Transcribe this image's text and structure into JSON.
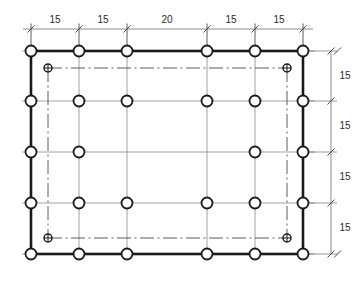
{
  "drawing": {
    "type": "structural-column-grid-plan",
    "title": "",
    "units": "",
    "colors": {
      "outline": "#1a1a1a",
      "gridline": "#8c8c8c",
      "dimension": "#6e6e6e",
      "centerline": "#4a4a4a",
      "column_fill": "#ffffff",
      "background": "#ffffff"
    },
    "horizontal_dimensions": {
      "label": "top-dimension-chain",
      "spans": [
        "15",
        "15",
        "20",
        "15",
        "15"
      ],
      "total_bays": 5
    },
    "vertical_dimensions": {
      "label": "right-dimension-chain",
      "spans": [
        "15",
        "15",
        "15",
        "15"
      ],
      "total_bays": 4
    },
    "grid": {
      "column_count": 6,
      "row_count": 5,
      "column_x": [
        31,
        79,
        127,
        207,
        255,
        303
      ],
      "row_y": [
        51,
        101,
        152,
        203,
        254
      ],
      "columns_present": [
        [
          1,
          1,
          1,
          1,
          1,
          1
        ],
        [
          1,
          1,
          1,
          1,
          1,
          1
        ],
        [
          1,
          1,
          0,
          0,
          1,
          1
        ],
        [
          1,
          1,
          1,
          1,
          1,
          1
        ],
        [
          1,
          1,
          1,
          1,
          1,
          1
        ]
      ],
      "column_marker_radius": 5.5
    },
    "inner_markers": {
      "label": "inset-crosshair-columns",
      "radius": 4,
      "points": [
        {
          "x": 48,
          "y": 68
        },
        {
          "x": 287,
          "y": 68
        },
        {
          "x": 48,
          "y": 238
        },
        {
          "x": 287,
          "y": 238
        }
      ]
    },
    "centerlines": {
      "style": "dash-dot",
      "segments": [
        {
          "name": "top-centerline",
          "x1": 48,
          "y1": 68,
          "x2": 287,
          "y2": 68
        },
        {
          "name": "bottom-centerline",
          "x1": 48,
          "y1": 238,
          "x2": 287,
          "y2": 238
        },
        {
          "name": "left-centerline",
          "x1": 48,
          "y1": 68,
          "x2": 48,
          "y2": 238
        },
        {
          "name": "right-centerline",
          "x1": 287,
          "y1": 68,
          "x2": 287,
          "y2": 238
        }
      ]
    },
    "outline": {
      "label": "perimeter-beam-outline",
      "x": 31,
      "y": 51,
      "width": 272,
      "height": 203,
      "stroke_width": 2.6
    }
  }
}
